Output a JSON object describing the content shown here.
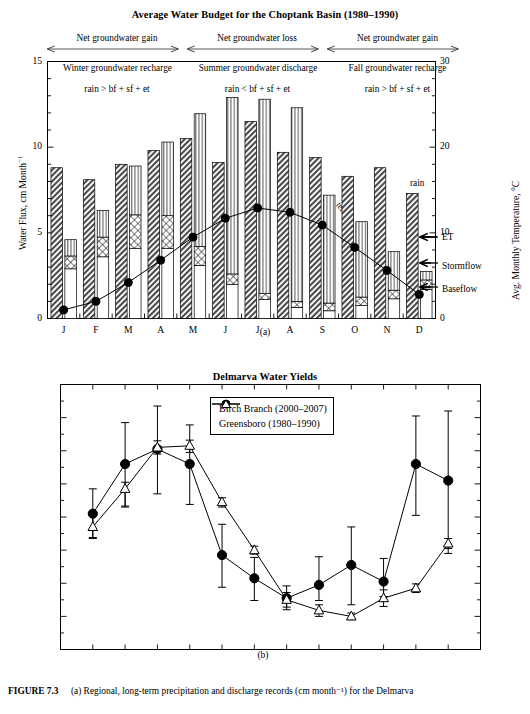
{
  "figure": {
    "number": "FIGURE 7.3",
    "caption": "(a) Regional, long-term precipitation and discharge records (cm month⁻¹) for the Delmarva"
  },
  "panel_a": {
    "tag": "(a)",
    "title": "Average Water Budget for the Choptank Basin (1980–1990)",
    "y_left_label": "Water Flux, cm Month⁻¹",
    "y_right_label": "Avg. Monthly Temperature, °C",
    "bands": [
      {
        "label": "Net groundwater gain",
        "sub": "Winter groundwater recharge",
        "eq": "rain > bf + sf + et"
      },
      {
        "label": "Net groundwater loss",
        "sub": "Summer groundwater discharge",
        "eq": "rain < bf + sf + et"
      },
      {
        "label": "Net groundwater gain",
        "sub": "Fall groundwater recharge",
        "eq": "rain > bf + sf + et"
      }
    ],
    "annotations": {
      "temp": "temp.",
      "rain": "rain",
      "et": "ET",
      "stormflow": "Stormflow",
      "baseflow": "Baseflow"
    }
  },
  "panel_b": {
    "tag": "(b)",
    "title": "Delmarva Water Yields",
    "y_label": "Discharge, cm Month⁻¹"
  },
  "chart_data": [
    {
      "type": "bar",
      "id": "water-budget",
      "title": "Average Water Budget for the Choptank Basin (1980–1990)",
      "xlabel": "",
      "ylabel": "Water Flux, cm Month⁻¹",
      "ylabel_right": "Avg. Monthly Temperature, °C",
      "categories": [
        "J",
        "F",
        "M",
        "A",
        "M",
        "J",
        "J",
        "A",
        "S",
        "O",
        "N",
        "D"
      ],
      "ylim": [
        0,
        15
      ],
      "ylim_right": [
        0,
        30
      ],
      "yticks": [
        0,
        5,
        10,
        15
      ],
      "yticks_right": [
        0,
        10,
        20,
        30
      ],
      "grid": false,
      "series": [
        {
          "name": "rain",
          "style": "diagonal-hatch-bar",
          "values": [
            8.8,
            8.1,
            9.0,
            9.8,
            10.5,
            9.1,
            11.5,
            9.7,
            9.4,
            8.3,
            8.8,
            7.3
          ]
        },
        {
          "name": "Baseflow",
          "style": "white-bar-segment",
          "values": [
            2.9,
            3.6,
            4.1,
            4.1,
            3.1,
            2.0,
            1.1,
            0.65,
            0.45,
            0.75,
            1.15,
            1.7
          ]
        },
        {
          "name": "Stormflow",
          "style": "cross-hatch-bar-segment",
          "values": [
            0.75,
            1.15,
            1.95,
            1.9,
            1.1,
            0.6,
            0.35,
            0.35,
            0.45,
            0.5,
            0.5,
            0.55
          ]
        },
        {
          "name": "ET",
          "style": "vertical-line-bar-segment",
          "values": [
            0.95,
            1.55,
            2.85,
            4.3,
            7.75,
            10.3,
            11.35,
            11.3,
            6.3,
            4.4,
            2.25,
            0.5
          ]
        },
        {
          "name": "temp.",
          "style": "filled-circle-line",
          "axis": "right",
          "values": [
            1.0,
            2.0,
            4.2,
            6.8,
            9.5,
            11.7,
            12.9,
            12.4,
            10.9,
            8.3,
            5.6,
            2.8
          ]
        }
      ],
      "stacked_totals": [
        4.6,
        6.3,
        8.9,
        10.3,
        11.95,
        12.9,
        12.8,
        12.3,
        7.2,
        5.65,
        3.9,
        2.75
      ]
    },
    {
      "type": "line",
      "id": "delmarva-water-yields",
      "title": "Delmarva Water Yields",
      "xlabel": "",
      "ylabel": "Discharge, cm Month⁻¹",
      "categories": [
        "J",
        "F",
        "M",
        "A",
        "M",
        "J",
        "J",
        "A",
        "S",
        "O",
        "N",
        "D"
      ],
      "ylim": [
        0,
        8
      ],
      "yticks": [
        0,
        1,
        2,
        3,
        4,
        5,
        6,
        7,
        8
      ],
      "grid": false,
      "legend_position": "top-right",
      "series": [
        {
          "name": "Birch Branch (2000–2007)",
          "marker": "filled-circle",
          "values": [
            4.1,
            5.6,
            6.05,
            5.6,
            2.85,
            2.15,
            1.55,
            1.95,
            2.55,
            2.05,
            5.6,
            5.1
          ],
          "err_low": [
            3.38,
            4.33,
            4.7,
            4.38,
            1.88,
            1.48,
            1.2,
            1.48,
            1.35,
            1.6,
            4.05,
            2.9
          ],
          "err_high": [
            4.85,
            6.85,
            7.35,
            6.78,
            3.78,
            2.78,
            1.92,
            2.8,
            3.7,
            2.75,
            7.05,
            7.2
          ]
        },
        {
          "name": "Greensboro (1980–1990)",
          "marker": "open-triangle",
          "values": [
            3.7,
            4.85,
            6.1,
            6.15,
            4.45,
            3.0,
            1.5,
            1.18,
            1.0,
            1.55,
            1.85,
            3.2
          ],
          "err_low": [
            3.35,
            4.3,
            5.9,
            5.95,
            4.3,
            2.88,
            1.28,
            1.0,
            0.9,
            1.3,
            1.72,
            3.05
          ],
          "err_high": [
            4.05,
            5.05,
            6.3,
            6.32,
            4.58,
            3.12,
            1.72,
            1.35,
            1.1,
            1.8,
            1.98,
            3.35
          ]
        }
      ]
    }
  ]
}
